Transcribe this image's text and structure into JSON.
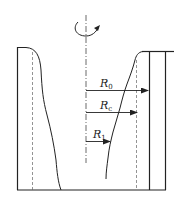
{
  "diagram": {
    "rotation_symbol": "rotation-arrow",
    "labels": {
      "r0": {
        "main": "R",
        "sub": "0"
      },
      "rc": {
        "main": "R",
        "sub": "c"
      },
      "r1": {
        "main": "R",
        "sub": "1"
      }
    },
    "colors": {
      "stroke": "#222222",
      "dashed": "#555555",
      "background": "#ffffff"
    }
  }
}
